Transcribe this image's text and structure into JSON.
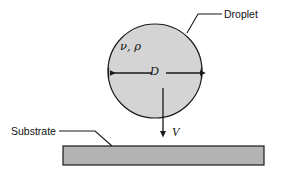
{
  "figure": {
    "type": "schematic-diagram",
    "background_color": "#ffffff",
    "line_color": "#1a1a1a",
    "droplet_fill": "#d4d4d4",
    "substrate_fill": "#b3b3b3"
  },
  "labels": {
    "droplet": "Droplet",
    "substrate": "Substrate",
    "properties": "ν, ρ",
    "diameter": "D",
    "velocity": "V"
  },
  "icons": {
    "droplet_shape": "circle-icon",
    "substrate_shape": "rectangle-icon",
    "diameter_arrow": "double-headed-arrow-icon",
    "velocity_arrow": "down-arrow-icon",
    "droplet_leader": "leader-line-icon",
    "substrate_leader": "leader-line-icon"
  },
  "geometry": {
    "droplet": {
      "cx": 155,
      "cy": 71,
      "r": 47
    },
    "substrate": {
      "x": 63,
      "y": 146,
      "width": 201,
      "height": 19
    },
    "diameter_line_y": 73,
    "velocity_arrow_x": 163,
    "velocity_arrow_top": 88,
    "velocity_arrow_bottom": 133
  }
}
